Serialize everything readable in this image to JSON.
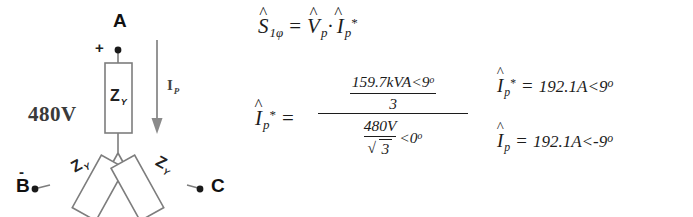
{
  "diagram": {
    "line_voltage_label": "480V",
    "nodes": [
      {
        "name": "A",
        "label": "A",
        "polarity": "+"
      },
      {
        "name": "B",
        "label": "B",
        "polarity": "-"
      },
      {
        "name": "C",
        "label": "C",
        "polarity": ""
      }
    ],
    "impedances": [
      {
        "symbol": "Z",
        "subscript": "Y",
        "position": "top"
      },
      {
        "symbol": "Z",
        "subscript": "Y",
        "position": "bottom-left"
      },
      {
        "symbol": "Z",
        "subscript": "Y",
        "position": "bottom-right"
      }
    ],
    "current_arrow": {
      "symbol": "I",
      "subscript": "P",
      "direction": "down"
    },
    "colors": {
      "stroke": "#7d7d7d",
      "node_dot": "#1a1a1a",
      "text": "#1a1a1a",
      "voltage_text": "#3a3a3a"
    }
  },
  "equations": {
    "eq1": {
      "lhs_symbol": "S",
      "lhs_subscript": "1φ",
      "equals": "=",
      "rhs_v_symbol": "V",
      "rhs_v_subscript": "p",
      "dot": "·",
      "rhs_i_symbol": "I",
      "rhs_i_subscript": "p",
      "rhs_i_star": "*"
    },
    "eq2": {
      "lhs_symbol": "I",
      "lhs_subscript": "p",
      "lhs_star": "*",
      "equals": "=",
      "numerator": {
        "top": "159.7kVA<9",
        "top_degree": "o",
        "bottom": "3"
      },
      "denominator": {
        "frac_top": "480V",
        "frac_bottom_radicand": "3",
        "radical": "√",
        "angle": "<0",
        "angle_degree": "o"
      }
    },
    "result1": {
      "lhs_symbol": "I",
      "lhs_subscript": "p",
      "lhs_star": "*",
      "equals": "=",
      "value": "192.1A<9",
      "degree": "o"
    },
    "result2": {
      "lhs_symbol": "I",
      "lhs_subscript": "p",
      "equals": "=",
      "value": "192.1A<-9",
      "degree": "o"
    }
  }
}
